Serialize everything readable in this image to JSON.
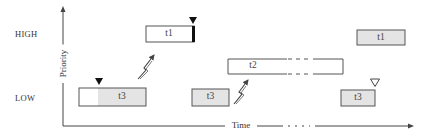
{
  "axes": {
    "y_title": "Priority",
    "x_title": "Time",
    "levels": {
      "high": "HIGH",
      "low": "LOW"
    }
  },
  "tasks": [
    {
      "id": "t3-low-first",
      "label": "t3",
      "level": "LOW",
      "fill": "split",
      "x": 79,
      "w": 67,
      "y": 88,
      "h": 18,
      "white_portion": 19
    },
    {
      "id": "t1-high-first",
      "label": "t1",
      "level": "HIGH",
      "fill": "white",
      "x": 146,
      "w": 49,
      "y": 26,
      "h": 16,
      "terminated_bar": true
    },
    {
      "id": "t3-low-second",
      "label": "t3",
      "level": "LOW",
      "fill": "gray",
      "x": 192,
      "w": 37,
      "y": 89,
      "h": 17
    },
    {
      "id": "t2-mid",
      "label": "t2",
      "level": "MEDIUM",
      "fill": "white",
      "x": 228,
      "w": 115,
      "y": 59,
      "h": 15,
      "dashed_gap": [
        287,
        313
      ]
    },
    {
      "id": "t1-high-second",
      "label": "t1",
      "level": "HIGH",
      "fill": "gray",
      "x": 357,
      "w": 48,
      "y": 30,
      "h": 15
    },
    {
      "id": "t3-low-third",
      "label": "t3",
      "level": "LOW",
      "fill": "gray",
      "x": 341,
      "w": 34,
      "y": 90,
      "h": 16
    }
  ],
  "markers": [
    {
      "type": "filled-triangle",
      "x": 99,
      "y": 77,
      "meaning": "t3 acquires resource"
    },
    {
      "type": "filled-triangle",
      "x": 193,
      "y": 17,
      "meaning": "t1 blocks on resource"
    },
    {
      "type": "hollow-triangle",
      "x": 375,
      "y": 78,
      "meaning": "t3 releases resource"
    }
  ],
  "events": [
    {
      "type": "lightning-arrow",
      "from": [
        137,
        79
      ],
      "to": [
        156,
        52
      ],
      "meaning": "t1 preempts t3"
    },
    {
      "type": "lightning-arrow",
      "from": [
        234,
        104
      ],
      "to": [
        250,
        79
      ],
      "meaning": "t2 preempts t3"
    }
  ],
  "colors": {
    "stroke": "#555555",
    "gray_fill": "#e4e4e4",
    "axis": "#444444",
    "text": "#333333"
  }
}
